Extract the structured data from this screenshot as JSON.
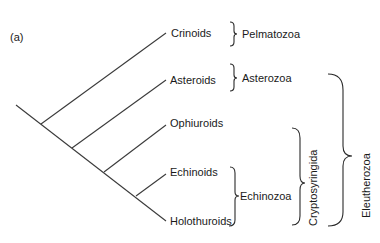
{
  "panel_label": "(a)",
  "taxa": [
    {
      "name": "Crinoids"
    },
    {
      "name": "Asteroids"
    },
    {
      "name": "Ophiuroids"
    },
    {
      "name": "Echinoids"
    },
    {
      "name": "Holothuroids"
    }
  ],
  "groups": {
    "pelmatozoa": "Pelmatozoa",
    "asterozoa": "Asterozoa",
    "echinozoa": "Echinozoa",
    "cryptosyringida": "Cryptosyringida",
    "eleutherozoa": "Eleutherozoa"
  },
  "colors": {
    "line": "#3a3a3a",
    "text": "#1a1a1a",
    "background": "#ffffff"
  }
}
